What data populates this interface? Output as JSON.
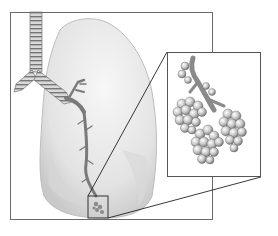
{
  "figure": {
    "main_panel": "Lung with trachea and bronchial tree",
    "inset_panel": "Magnified alveoli clusters at end of bronchiole",
    "colors": {
      "lung_fill": "#ececec",
      "lung_shade": "#cfcfcf",
      "airway": "#8a8a8a",
      "alveoli": "#bdbdbd",
      "frame": "#6a6a6a"
    }
  }
}
